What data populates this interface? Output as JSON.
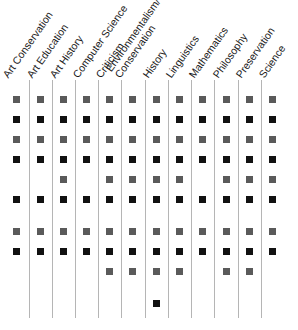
{
  "chart_data": {
    "type": "table",
    "title": "",
    "columns": [
      "Art Conservation",
      "Art Education",
      "Art History",
      "Computer Science",
      "Criticism",
      "Environmentalism/ Conservation",
      "History",
      "Linguistics",
      "Mathematics",
      "Philosophy",
      "Preservation",
      "Science"
    ],
    "column_label_lines": [
      [
        "Art Conservation"
      ],
      [
        "Art Education"
      ],
      [
        "Art History"
      ],
      [
        "Computer Science"
      ],
      [
        "Criticism"
      ],
      [
        "Environmentalism/",
        "Conservation"
      ],
      [
        "History"
      ],
      [
        "Linguistics"
      ],
      [
        "Mathematics"
      ],
      [
        "Philosophy"
      ],
      [
        "Preservation"
      ],
      [
        "Science"
      ]
    ],
    "row_styles": [
      "gray",
      "black",
      "gray",
      "black",
      "gray",
      "black",
      "gray",
      "black",
      "gray",
      "black"
    ],
    "matrix": [
      [
        1,
        1,
        1,
        1,
        1,
        1,
        1,
        1,
        1,
        1,
        1,
        1
      ],
      [
        1,
        1,
        1,
        1,
        1,
        1,
        1,
        1,
        1,
        1,
        1,
        1
      ],
      [
        1,
        1,
        1,
        1,
        1,
        1,
        1,
        1,
        1,
        1,
        1,
        1
      ],
      [
        1,
        1,
        1,
        1,
        1,
        1,
        1,
        1,
        1,
        1,
        1,
        1
      ],
      [
        0,
        0,
        1,
        0,
        1,
        1,
        1,
        1,
        0,
        1,
        1,
        1
      ],
      [
        1,
        1,
        1,
        1,
        1,
        1,
        1,
        1,
        1,
        1,
        1,
        1
      ],
      [
        1,
        1,
        1,
        1,
        1,
        1,
        1,
        1,
        1,
        1,
        1,
        1
      ],
      [
        1,
        1,
        1,
        1,
        1,
        1,
        1,
        1,
        1,
        1,
        1,
        1
      ],
      [
        0,
        0,
        0,
        0,
        1,
        1,
        1,
        1,
        0,
        1,
        1,
        0
      ],
      [
        0,
        0,
        0,
        0,
        0,
        0,
        1,
        0,
        0,
        0,
        0,
        0
      ]
    ],
    "legend": [],
    "grid": "vertical separators between columns"
  },
  "colors": {
    "black_marker": "#111111",
    "gray_marker": "#5a5a5a",
    "separator": "#b5b5b5",
    "label_text": "#1a1a1a"
  }
}
